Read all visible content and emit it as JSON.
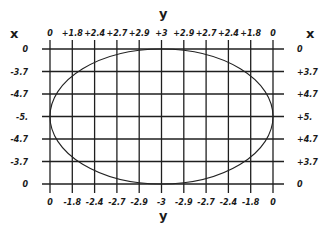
{
  "chart_data": {
    "type": "line",
    "title": "",
    "x_axis_name": "x",
    "y_axis_name": "y",
    "top_labels": [
      "0",
      "+1.8",
      "+2.4",
      "+2.7",
      "+2.9",
      "+3",
      "+2.9",
      "+2.7",
      "+2.4",
      "+1.8",
      "0"
    ],
    "bottom_labels": [
      "0",
      "-1.8",
      "-2.4",
      "-2.7",
      "-2.9",
      "-3",
      "-2.9",
      "-2.7",
      "-2.4",
      "-1.8",
      "0"
    ],
    "left_labels": [
      "0",
      "-3.7",
      "-4.7",
      "-5.",
      "-4.7",
      "-3.7",
      "0"
    ],
    "right_labels": [
      "0",
      "+3.7",
      "+4.7",
      "+5.",
      "+4.7",
      "+3.7",
      "0"
    ],
    "grid": true,
    "series": [
      {
        "name": "ellipse",
        "shape": "ellipse",
        "semi_axis_x": 5,
        "semi_axis_y": 3
      }
    ]
  },
  "labels": {
    "top_axis": "y",
    "bottom_axis": "y",
    "left_axis": "x",
    "right_axis": "x"
  },
  "colors": {
    "ink": "#1f1f1f",
    "background": "#ffffff"
  }
}
